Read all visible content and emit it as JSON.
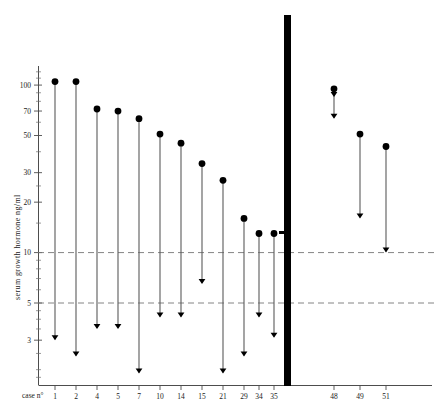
{
  "chart_data": {
    "type": "scatter",
    "title": "",
    "subtitle": "",
    "xlabel": "case n°",
    "ylabel": "serum  growth  hormone  ng/ml",
    "yscale": "log",
    "ylim": [
      1.6,
      130
    ],
    "ytick_labels": [
      "100",
      "70",
      "50",
      "30",
      "20",
      "10",
      "5",
      "3"
    ],
    "ytick_values": [
      100,
      70,
      50,
      30,
      20,
      10,
      5,
      3
    ],
    "grid": "horizontal-dashed-at-10-and-5",
    "gridline_values": [
      10,
      5
    ],
    "legend": "none",
    "annotations": [
      "Filled circle = basal serum growth hormone value",
      "Downward arrow = value after suppression / lower measured level"
    ],
    "groups": [
      {
        "name": "left-group",
        "categories": [
          "1",
          "2",
          "4",
          "5",
          "7",
          "10",
          "14",
          "15",
          "21",
          "29",
          "34",
          "35"
        ],
        "start_values": [
          105,
          105,
          72,
          70,
          63,
          51,
          45,
          34,
          27,
          16,
          13,
          13
        ],
        "end_values": [
          3.0,
          2.4,
          3.5,
          3.5,
          1.9,
          4.1,
          4.1,
          6.5,
          1.9,
          2.4,
          4.1,
          3.1
        ]
      },
      {
        "name": "right-group",
        "categories": [
          "48",
          "49",
          "51"
        ],
        "start_values": [
          95,
          51,
          43
        ],
        "end_values": [
          63,
          16,
          10
        ],
        "extra_markers": [
          {
            "category": "48",
            "value": 85,
            "marker": "arrow"
          }
        ]
      }
    ],
    "separator": {
      "type": "thick-vertical-bar",
      "x_position_between": [
        "35",
        "48"
      ]
    }
  },
  "axis": {
    "y_title": "serum  growth  hormone  ng/ml",
    "x_caption": "case n°",
    "ticks": [
      {
        "label": "100",
        "value": 100
      },
      {
        "label": "70",
        "value": 70
      },
      {
        "label": "50",
        "value": 50
      },
      {
        "label": "30",
        "value": 30
      },
      {
        "label": "20",
        "value": 20
      },
      {
        "label": "10",
        "value": 10
      },
      {
        "label": "5",
        "value": 5
      },
      {
        "label": "3",
        "value": 3
      }
    ]
  },
  "colors": {
    "marker": "#000000",
    "line": "#5a5a5a",
    "axis": "#4d4d4d",
    "gridline": "#777777",
    "background": "#ffffff",
    "divider": "#000000"
  }
}
